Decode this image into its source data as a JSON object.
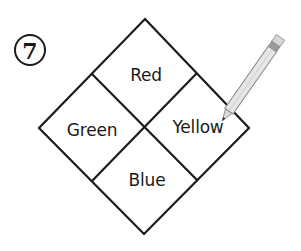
{
  "step": {
    "number": "7"
  },
  "diagram": {
    "type": "four-quadrant diamond",
    "stroke_color": "#1a1a1a",
    "quadrants": [
      {
        "position": "top",
        "label": "Red"
      },
      {
        "position": "left",
        "label": "Green"
      },
      {
        "position": "right",
        "label": "Yellow"
      },
      {
        "position": "bottom",
        "label": "Blue"
      }
    ]
  },
  "pencil": {
    "icon": "pencil-icon",
    "body_color": "#e6e6e6",
    "outline_color": "#8a8a8a",
    "eraser_band_color": "#9a9a9a",
    "tip_color": "#333333"
  }
}
